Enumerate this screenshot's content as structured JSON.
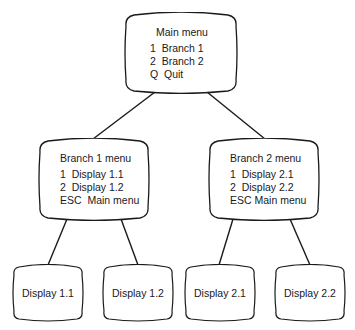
{
  "diagram": {
    "type": "menu-hierarchy",
    "main": {
      "title": "Main menu",
      "options": [
        "1  Branch 1",
        "2  Branch 2",
        "Q  Quit"
      ]
    },
    "branches": [
      {
        "title": "Branch 1 menu",
        "options": [
          "1  Display 1.1",
          "2  Display 1.2",
          "ESC  Main menu"
        ],
        "displays": [
          "Display 1.1",
          "Display 1.2"
        ]
      },
      {
        "title": "Branch 2 menu",
        "options": [
          "1  Display 2.1",
          "2  Display 2.2",
          "ESC Main menu"
        ],
        "displays": [
          "Display 2.1",
          "Display 2.2"
        ]
      }
    ],
    "colors": {
      "stroke": "#1a1a1a",
      "background": "#ffffff"
    }
  }
}
